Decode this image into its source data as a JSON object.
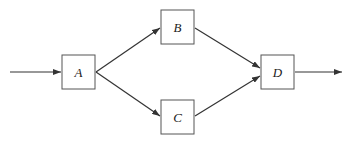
{
  "diagram": {
    "type": "flow-network",
    "colors": {
      "stroke": "#333333",
      "background": "#ffffff",
      "text": "#222222"
    },
    "nodes": [
      {
        "id": "A",
        "label": "A",
        "x": 62,
        "y": 55,
        "w": 33,
        "h": 34
      },
      {
        "id": "B",
        "label": "B",
        "x": 161,
        "y": 10,
        "w": 33,
        "h": 34
      },
      {
        "id": "C",
        "label": "C",
        "x": 161,
        "y": 100,
        "w": 33,
        "h": 34
      },
      {
        "id": "D",
        "label": "D",
        "x": 261,
        "y": 55,
        "w": 33,
        "h": 34
      }
    ],
    "edges": [
      {
        "from": "input",
        "to": "A"
      },
      {
        "from": "A",
        "to": "B"
      },
      {
        "from": "A",
        "to": "C"
      },
      {
        "from": "B",
        "to": "D"
      },
      {
        "from": "C",
        "to": "D"
      },
      {
        "from": "D",
        "to": "output"
      }
    ]
  }
}
